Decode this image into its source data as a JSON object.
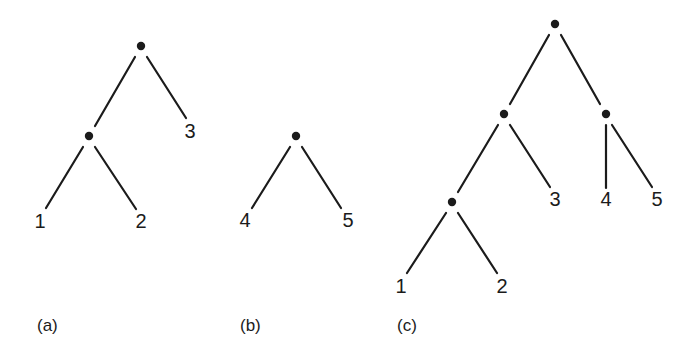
{
  "figure": {
    "background_color": "#ffffff",
    "ink_color": "#1b1b1b",
    "width": 698,
    "height": 355
  },
  "style": {
    "edge_stroke_width": 2.2,
    "node_radius": 4.2,
    "leaf_font_size": 20,
    "caption_font_size": 17
  },
  "panels": [
    {
      "id": "panel-a",
      "caption": "(a)",
      "caption_x": 37,
      "caption_y": 327,
      "nodes": [
        {
          "name": "root",
          "x": 141,
          "y": 46
        },
        {
          "name": "internal-1",
          "x": 89,
          "y": 136
        }
      ],
      "edges": [
        {
          "name": "root-to-internal-1",
          "x1": 135,
          "y1": 57,
          "x2": 95,
          "y2": 126
        },
        {
          "name": "root-to-leaf-3",
          "x1": 147,
          "y1": 57,
          "x2": 186,
          "y2": 118
        },
        {
          "name": "internal-1-to-leaf-1",
          "x1": 83,
          "y1": 147,
          "x2": 46,
          "y2": 208
        },
        {
          "name": "internal-1-to-leaf-2",
          "x1": 95,
          "y1": 147,
          "x2": 136,
          "y2": 209
        }
      ],
      "leaves": [
        {
          "name": "leaf-1",
          "label": "1",
          "x": 40,
          "y": 223
        },
        {
          "name": "leaf-2",
          "label": "2",
          "x": 141,
          "y": 223
        },
        {
          "name": "leaf-3",
          "label": "3",
          "x": 190,
          "y": 133
        }
      ]
    },
    {
      "id": "panel-b",
      "caption": "(b)",
      "caption_x": 240,
      "caption_y": 327,
      "nodes": [
        {
          "name": "root",
          "x": 296,
          "y": 136
        }
      ],
      "edges": [
        {
          "name": "root-to-leaf-4",
          "x1": 290,
          "y1": 147,
          "x2": 252,
          "y2": 208
        },
        {
          "name": "root-to-leaf-5",
          "x1": 302,
          "y1": 147,
          "x2": 341,
          "y2": 208
        }
      ],
      "leaves": [
        {
          "name": "leaf-4",
          "label": "4",
          "x": 245,
          "y": 222
        },
        {
          "name": "leaf-5",
          "label": "5",
          "x": 348,
          "y": 222
        }
      ]
    },
    {
      "id": "panel-c",
      "caption": "(c)",
      "caption_x": 397,
      "caption_y": 327,
      "nodes": [
        {
          "name": "root",
          "x": 555,
          "y": 24
        },
        {
          "name": "internal-left",
          "x": 504,
          "y": 114
        },
        {
          "name": "internal-right",
          "x": 606,
          "y": 114
        },
        {
          "name": "internal-lower-left",
          "x": 452,
          "y": 202
        }
      ],
      "edges": [
        {
          "name": "root-to-internal-left",
          "x1": 549,
          "y1": 35,
          "x2": 510,
          "y2": 104
        },
        {
          "name": "root-to-internal-right",
          "x1": 561,
          "y1": 35,
          "x2": 600,
          "y2": 104
        },
        {
          "name": "internal-left-to-internal-lower-left",
          "x1": 498,
          "y1": 125,
          "x2": 458,
          "y2": 192
        },
        {
          "name": "internal-left-to-leaf-3",
          "x1": 510,
          "y1": 125,
          "x2": 550,
          "y2": 187
        },
        {
          "name": "internal-right-to-leaf-4",
          "x1": 606,
          "y1": 125,
          "x2": 606,
          "y2": 188
        },
        {
          "name": "internal-right-to-leaf-5",
          "x1": 612,
          "y1": 125,
          "x2": 652,
          "y2": 187
        },
        {
          "name": "internal-lower-left-to-leaf-1",
          "x1": 446,
          "y1": 213,
          "x2": 407,
          "y2": 273
        },
        {
          "name": "internal-lower-left-to-leaf-2",
          "x1": 458,
          "y1": 213,
          "x2": 497,
          "y2": 273
        }
      ],
      "leaves": [
        {
          "name": "leaf-1",
          "label": "1",
          "x": 401,
          "y": 288
        },
        {
          "name": "leaf-2",
          "label": "2",
          "x": 502,
          "y": 288
        },
        {
          "name": "leaf-3",
          "label": "3",
          "x": 555,
          "y": 201
        },
        {
          "name": "leaf-4",
          "label": "4",
          "x": 606,
          "y": 201
        },
        {
          "name": "leaf-5",
          "label": "5",
          "x": 657,
          "y": 201
        }
      ]
    }
  ]
}
